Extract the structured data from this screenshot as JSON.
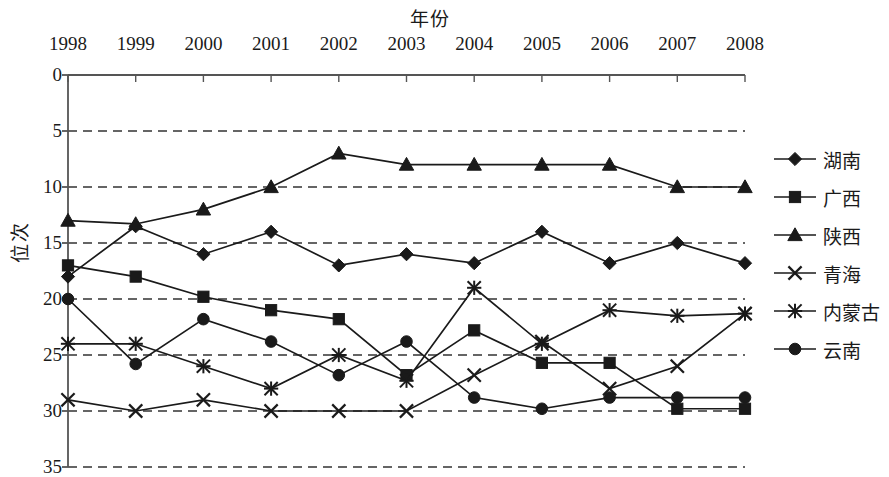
{
  "chart_data": {
    "type": "line",
    "title": "",
    "xlabel": "年份",
    "ylabel": "位次",
    "categories": [
      "1998",
      "1999",
      "2000",
      "2001",
      "2002",
      "2003",
      "2004",
      "2005",
      "2006",
      "2007",
      "2008"
    ],
    "x": [
      1998,
      1999,
      2000,
      2001,
      2002,
      2003,
      2004,
      2005,
      2006,
      2007,
      2008
    ],
    "xlim": [
      1998,
      2008
    ],
    "ylim": [
      0,
      35
    ],
    "y_inverted": true,
    "y_ticks": [
      0,
      5,
      10,
      15,
      20,
      25,
      30,
      35
    ],
    "grid": "horizontal-dashed",
    "legend_position": "right",
    "series": [
      {
        "name": "湖南",
        "marker": "diamond",
        "values": [
          18,
          13.5,
          16,
          14,
          17,
          16,
          16.8,
          14,
          16.8,
          15,
          16.8
        ]
      },
      {
        "name": "广西",
        "marker": "square",
        "values": [
          17,
          18,
          19.8,
          21,
          21.8,
          26.8,
          22.8,
          25.7,
          25.7,
          29.8,
          29.8
        ]
      },
      {
        "name": "陕西",
        "marker": "triangle",
        "values": [
          13,
          13.3,
          12,
          10,
          7,
          8,
          8,
          8,
          8,
          10,
          10
        ]
      },
      {
        "name": "青海",
        "marker": "cross",
        "values": [
          29,
          30,
          29,
          30,
          30,
          30,
          26.8,
          23.8,
          28,
          26,
          21.3
        ]
      },
      {
        "name": "内蒙古",
        "marker": "asterisk",
        "values": [
          24,
          24,
          26,
          28,
          25,
          27.3,
          19,
          24,
          21,
          21.5,
          21.3
        ]
      },
      {
        "name": "云南",
        "marker": "circle",
        "values": [
          20,
          25.8,
          21.8,
          23.8,
          26.8,
          23.8,
          28.8,
          29.8,
          28.8,
          28.8,
          28.8
        ]
      }
    ]
  },
  "legend": {
    "items": [
      {
        "label": "湖南",
        "marker": "diamond"
      },
      {
        "label": "广西",
        "marker": "square"
      },
      {
        "label": "陕西",
        "marker": "triangle"
      },
      {
        "label": "青海",
        "marker": "cross"
      },
      {
        "label": "内蒙古",
        "marker": "asterisk"
      },
      {
        "label": "云南",
        "marker": "circle"
      }
    ]
  },
  "style": {
    "line_color": "#1a1a1a",
    "grid_color": "#333333",
    "axis_color": "#555555",
    "background": "#ffffff"
  }
}
